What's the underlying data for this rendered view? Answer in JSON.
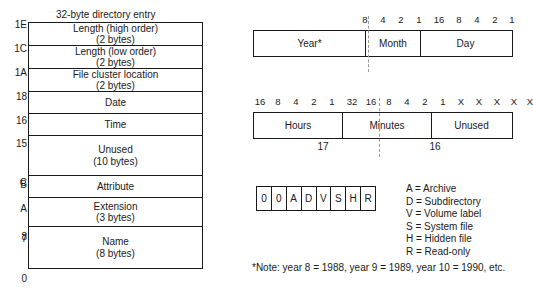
{
  "directory_entry": {
    "title": "32-byte directory entry",
    "rows": [
      {
        "offset": "1E",
        "line1": "Length (high order)",
        "line2": "(2 bytes)",
        "height": 23
      },
      {
        "offset": "1C",
        "line1": "Length (low order)",
        "line2": "(2 bytes)",
        "height": 23
      },
      {
        "offset": "1A",
        "line1": "File cluster location",
        "line2": "(2 bytes)",
        "height": 23
      },
      {
        "offset": "18",
        "line1": "Date",
        "line2": "",
        "height": 22
      },
      {
        "offset": "16",
        "line1": "Time",
        "line2": "",
        "height": 22
      },
      {
        "offset": "15",
        "line1": "Unused",
        "line2": "(10 bytes)",
        "height": 40,
        "offset_end": "C"
      },
      {
        "offset": "B",
        "line1": "Attribute",
        "line2": "",
        "height": 22
      },
      {
        "offset": "A",
        "line1": "Extension",
        "line2": "(3 bytes)",
        "height": 29,
        "offset_end": "8"
      },
      {
        "offset": "7",
        "line1": "Name",
        "line2": "(8 bytes)",
        "height": 41,
        "offset_end": "0"
      }
    ]
  },
  "date_field": {
    "bit_labels": [
      "8",
      "4",
      "2",
      "1",
      "16",
      "8",
      "4",
      "2",
      "1"
    ],
    "fields": [
      {
        "label": "Year*"
      },
      {
        "label": "Month"
      },
      {
        "label": "Day"
      }
    ]
  },
  "time_field": {
    "bit_labels": [
      "16",
      "8",
      "4",
      "2",
      "1",
      "32",
      "16",
      "8",
      "4",
      "2",
      "1",
      "X",
      "X",
      "X",
      "X",
      "X"
    ],
    "fields": [
      {
        "label": "Hours"
      },
      {
        "label": "Minutes"
      },
      {
        "label": "Unused"
      }
    ],
    "byte_labels": [
      "17",
      "16"
    ]
  },
  "attribute_byte": {
    "bits": [
      "0",
      "0",
      "A",
      "D",
      "V",
      "S",
      "H",
      "R"
    ],
    "legend": [
      "A = Archive",
      "D = Subdirectory",
      "V = Volume label",
      "S = System file",
      "H = Hidden file",
      "R = Read-only"
    ]
  },
  "footnote": "*Note: year 8 = 1988, year 9 = 1989, year 10 = 1990, etc.",
  "colors": {
    "line": "#1a1a1a",
    "dash": "#9a9a9a",
    "background": "#ffffff"
  }
}
